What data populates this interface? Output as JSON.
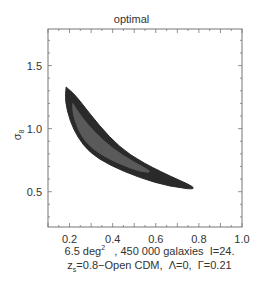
{
  "chart_data": {
    "type": "contour",
    "title": "optimal",
    "xlabel": "",
    "ylabel": "σ8",
    "xlim": [
      0.1,
      1.0
    ],
    "ylim": [
      0.22,
      1.79
    ],
    "x_ticks": [
      "0.2",
      "0.4",
      "0.6",
      "0.8",
      "1.0"
    ],
    "y_ticks": [
      "0.5",
      "1.0",
      "1.5"
    ],
    "grid": false,
    "legend": null,
    "caption_line1": {
      "main": "6.5 deg",
      "sup": "2",
      "rest": "   , 450 000 galaxies  I=24."
    },
    "caption_line2": {
      "pre": "z",
      "sub": "s",
      "rest": "=0.8−Open CDM,  Λ=0,  Γ=0.21"
    },
    "contours": [
      {
        "level": "outer (2σ)",
        "color": "#2a2a2a",
        "points": [
          [
            0.184,
            1.33
          ],
          [
            0.225,
            1.27
          ],
          [
            0.293,
            1.12
          ],
          [
            0.386,
            0.93
          ],
          [
            0.479,
            0.79
          ],
          [
            0.618,
            0.66
          ],
          [
            0.817,
            0.51
          ],
          [
            0.664,
            0.54
          ],
          [
            0.525,
            0.61
          ],
          [
            0.386,
            0.71
          ],
          [
            0.293,
            0.81
          ],
          [
            0.238,
            0.93
          ],
          [
            0.202,
            1.06
          ],
          [
            0.179,
            1.22
          ],
          [
            0.184,
            1.33
          ]
        ]
      },
      {
        "level": "inner (1σ)",
        "color": "#5a5a5a",
        "points": [
          [
            0.215,
            1.2
          ],
          [
            0.252,
            1.1
          ],
          [
            0.316,
            0.97
          ],
          [
            0.4,
            0.84
          ],
          [
            0.502,
            0.73
          ],
          [
            0.59,
            0.65
          ],
          [
            0.525,
            0.66
          ],
          [
            0.432,
            0.72
          ],
          [
            0.34,
            0.8
          ],
          [
            0.275,
            0.89
          ],
          [
            0.238,
            1.0
          ],
          [
            0.215,
            1.12
          ],
          [
            0.215,
            1.2
          ]
        ]
      }
    ],
    "values_summary": {
      "sigma8_range": [
        0.51,
        1.33
      ],
      "omega_range": [
        0.18,
        0.82
      ]
    }
  }
}
